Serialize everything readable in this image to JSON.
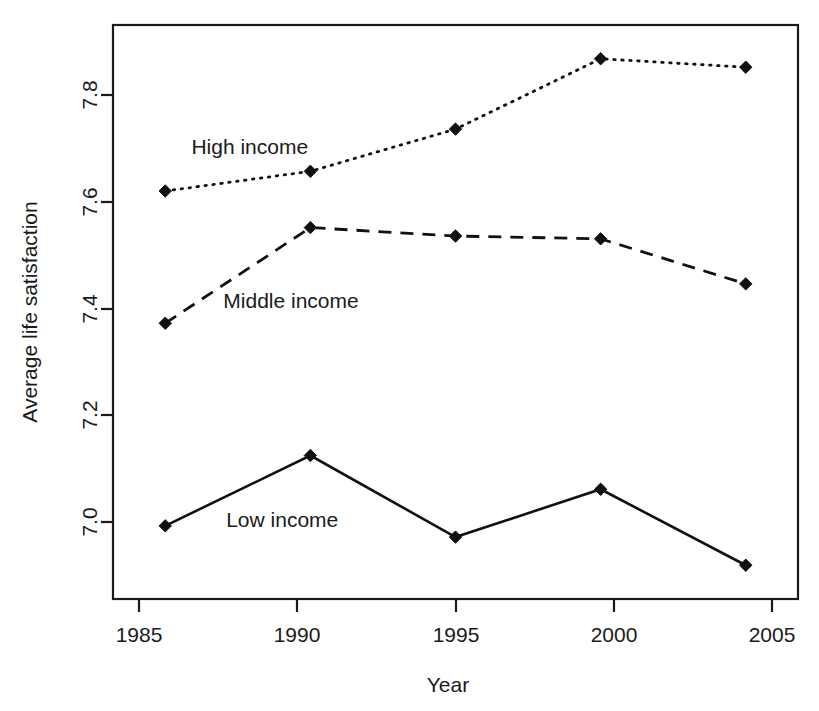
{
  "chart_data": {
    "type": "line",
    "title": "",
    "xlabel": "Year",
    "ylabel": "Average life satisfaction",
    "categories": [
      "1985",
      "1990",
      "1995",
      "2000",
      "2005"
    ],
    "x": [
      1985,
      1990,
      1995,
      2000,
      2005
    ],
    "xlim": [
      1983.2,
      2006.8
    ],
    "ylim": [
      6.9,
      7.92
    ],
    "xticks": [
      "1985",
      "1990",
      "1995",
      "2000",
      "2005"
    ],
    "yticks": [
      "7.0",
      "7.2",
      "7.4",
      "7.6",
      "7.8"
    ],
    "ytick_values": [
      7.0,
      7.2,
      7.4,
      7.6,
      7.8
    ],
    "grid": false,
    "legend_position": "inline-annotations",
    "series": [
      {
        "name": "High income",
        "style": "dotted",
        "values": [
          7.625,
          7.66,
          7.735,
          7.86,
          7.845
        ]
      },
      {
        "name": "Middle income",
        "style": "dashed",
        "values": [
          7.39,
          7.56,
          7.545,
          7.54,
          7.46
        ]
      },
      {
        "name": "Low income",
        "style": "solid",
        "values": [
          7.03,
          7.155,
          7.01,
          7.095,
          6.96
        ]
      }
    ],
    "annotations": [
      {
        "text": "High income",
        "x": 1985.9,
        "y": 7.69
      },
      {
        "text": "Middle income",
        "x": 1987.0,
        "y": 7.418
      },
      {
        "text": "Low income",
        "x": 1987.1,
        "y": 7.028
      }
    ]
  },
  "axes": {
    "x_title": "Year",
    "y_title": "Average life satisfaction"
  }
}
